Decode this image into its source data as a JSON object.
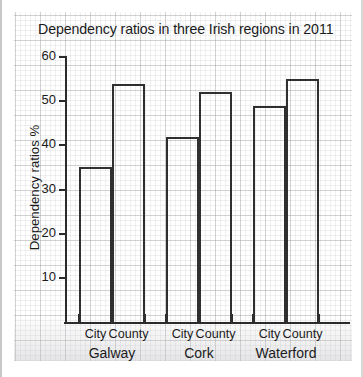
{
  "chart_data": {
    "type": "bar",
    "title": "Dependency ratios in three Irish regions in 2011",
    "xlabel": "",
    "ylabel": "Dependency ratios %",
    "ylim": [
      0,
      60
    ],
    "ytick_labels": [
      "10",
      "20",
      "30",
      "40",
      "50",
      "60"
    ],
    "ytick_values": [
      10,
      20,
      30,
      40,
      50,
      60
    ],
    "grid": true,
    "legend": "none",
    "categories": [
      "Galway City",
      "Galway County",
      "Cork City",
      "Cork County",
      "Waterford City",
      "Waterford County"
    ],
    "values": [
      35,
      54,
      42,
      52,
      49,
      55
    ],
    "groups": [
      {
        "label": "Galway",
        "bars": [
          {
            "sublabel": "City",
            "value": 35
          },
          {
            "sublabel": "County",
            "value": 54
          }
        ]
      },
      {
        "label": "Cork",
        "bars": [
          {
            "sublabel": "City",
            "value": 42
          },
          {
            "sublabel": "County",
            "value": 52
          }
        ]
      },
      {
        "label": "Waterford",
        "bars": [
          {
            "sublabel": "City",
            "value": 49
          },
          {
            "sublabel": "County",
            "value": 55
          }
        ]
      }
    ],
    "colors": {
      "bar_outline": "#2f2f2f",
      "bar_fill": "#ffffff",
      "axis": "#2b2b2b",
      "text": "#1b1b1b",
      "grid_major": "#96969b",
      "grid_minor": "#aaaab2",
      "paper": "#ffffff"
    }
  }
}
